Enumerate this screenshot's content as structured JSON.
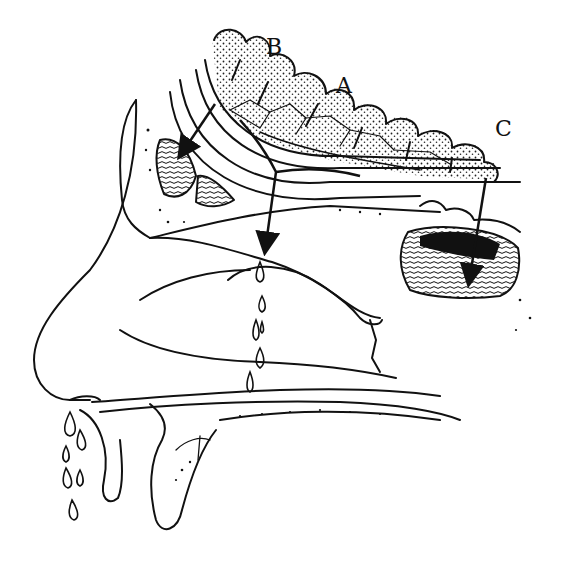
{
  "diagram": {
    "labels": [
      {
        "id": "A",
        "text": "A",
        "x": 336,
        "y": 75
      },
      {
        "id": "B",
        "text": "B",
        "x": 266,
        "y": 36
      },
      {
        "id": "C",
        "text": "C",
        "x": 495,
        "y": 118
      }
    ],
    "arrows": [
      {
        "name": "frontal-sinus-arrow",
        "from": [
          215,
          105
        ],
        "to": [
          180,
          160
        ]
      },
      {
        "name": "nasal-drainage-arrow",
        "from": [
          272,
          180
        ],
        "to": [
          262,
          252
        ]
      },
      {
        "name": "sphenoid-sinus-arrow",
        "from": [
          485,
          178
        ],
        "to": [
          468,
          282
        ]
      }
    ],
    "drops": {
      "nasal_cavity_count": 7,
      "nostril_count": 7
    },
    "colors": {
      "ink": "#111111",
      "background": "#ffffff",
      "stipple": "#222222"
    }
  }
}
